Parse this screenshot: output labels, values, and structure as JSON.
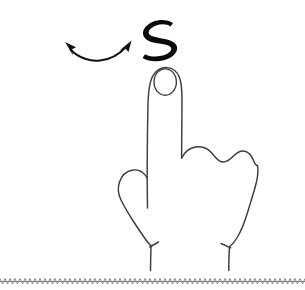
{
  "figure": {
    "title": "Hand gesture diagram: index finger extended with side-to-side motion",
    "background_color": "#ffffff",
    "width": 305,
    "height": 290
  },
  "colors": {
    "background": "#ffffff",
    "hand_outline": "#3c3c3c",
    "arrow": "#111111",
    "glyph": "#0a0a0a",
    "baseline": "#8a8a8a"
  },
  "annotations": {
    "motion_arrow": {
      "label": "double-headed curved arrow",
      "icon": "double-arrow-curved-icon",
      "direction": "left-right swipe",
      "color": "#111111"
    },
    "stroke_glyph": {
      "label": "S",
      "icon": "s-stroke-glyph-icon",
      "description": "hand drawn S stroke mark",
      "color": "#0a0a0a"
    }
  },
  "hand": {
    "label": "hand with extended index finger",
    "parts": {
      "index_finger": "index-finger",
      "fingernail": "fingernail",
      "knuckles": "folded-knuckles",
      "thumb_side": "thumb-contour",
      "wrist": "wrist"
    }
  },
  "baseline": {
    "label": "hatched ground line",
    "style": "sawtooth-hatch"
  }
}
